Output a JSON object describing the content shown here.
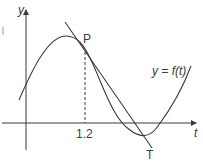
{
  "diagram": {
    "axes": {
      "y_label": "y",
      "x_label": "t"
    },
    "curve_label": "y = f(t)",
    "point_label": "P",
    "tangent_label": "T",
    "x_tick_label": "1.2",
    "colors": {
      "stroke": "#3a3a3a",
      "background": "#ffffff"
    }
  }
}
